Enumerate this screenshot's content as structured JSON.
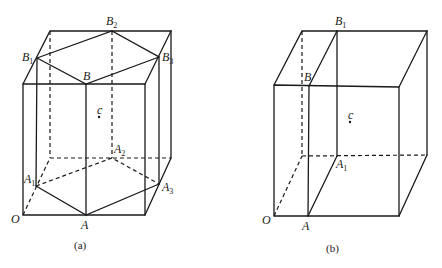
{
  "figure_a": {
    "caption": "(a)",
    "labels": {
      "B": "B",
      "B1": "B",
      "B1_sub": "1",
      "B2": "B",
      "B2_sub": "2",
      "B3": "B",
      "B3_sub": "3",
      "A": "A",
      "A1": "A",
      "A1_sub": "1",
      "A2": "A",
      "A2_sub": "2",
      "A3": "A",
      "A3_sub": "3",
      "O": "O",
      "c": "c"
    }
  },
  "figure_b": {
    "caption": "(b)",
    "labels": {
      "B": "B",
      "B1": "B",
      "B1_sub": "1",
      "A": "A",
      "A1": "A",
      "A1_sub": "1",
      "O": "O",
      "c": "c"
    }
  },
  "colors": {
    "line": "#1a1a1a",
    "background": "#ffffff"
  }
}
